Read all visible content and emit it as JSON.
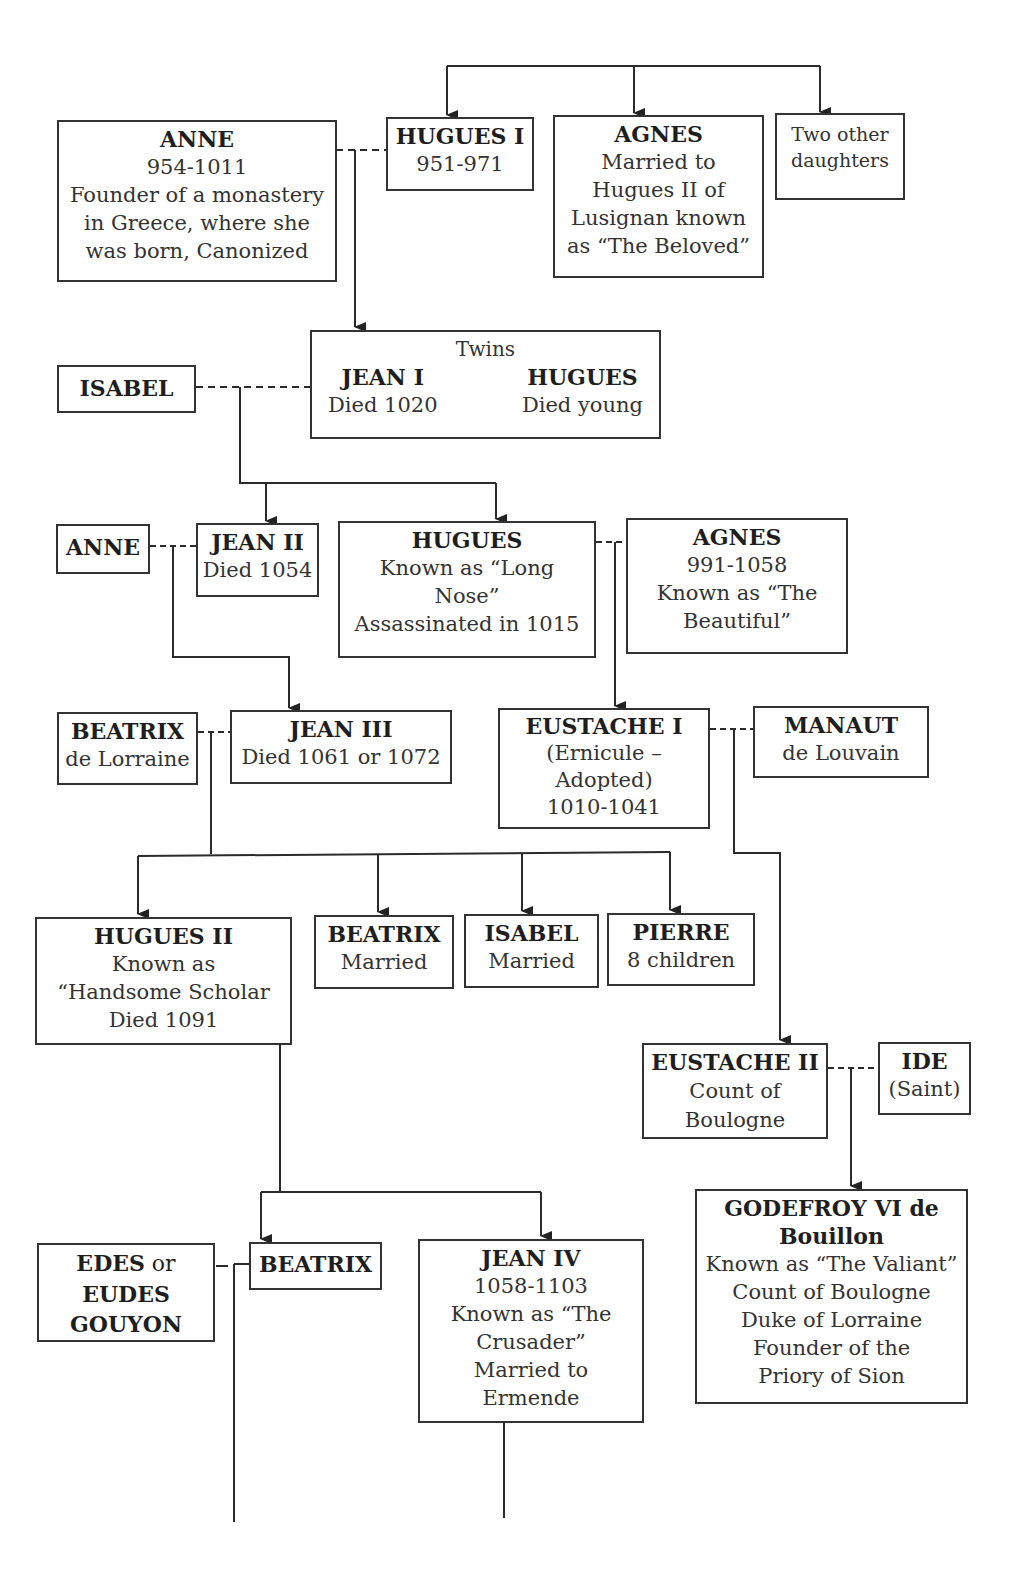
{
  "diagram": {
    "type": "family-tree",
    "nodes": {
      "anne_954": {
        "name": "ANNE",
        "lines": [
          "954-1011",
          "Founder of a monastery",
          "in Greece, where she",
          "was born, Canonized"
        ]
      },
      "hugues_i": {
        "name": "HUGUES I",
        "lines": [
          "951-971"
        ]
      },
      "agnes_beloved": {
        "name": "AGNES",
        "lines": [
          "Married to",
          "Hugues II of",
          "Lusignan known",
          "as “The Beloved”"
        ]
      },
      "two_daughters": {
        "name": "",
        "lines": [
          "Two other",
          "daughters"
        ]
      },
      "twins": {
        "caption": "Twins",
        "left_name": "JEAN I",
        "left_line": "Died 1020",
        "right_name": "HUGUES",
        "right_line": "Died young"
      },
      "isabel_1": {
        "name": "ISABEL",
        "lines": []
      },
      "anne_2": {
        "name": "ANNE",
        "lines": []
      },
      "jean_ii": {
        "name": "JEAN II",
        "lines": [
          "Died 1054"
        ]
      },
      "hugues_long_nose": {
        "name": "HUGUES",
        "lines": [
          "Known as “Long",
          "Nose”",
          "Assassinated in 1015"
        ]
      },
      "agnes_beautiful": {
        "name": "AGNES",
        "lines": [
          "991-1058",
          "Known as “The",
          "Beautiful”"
        ]
      },
      "beatrix_lorraine": {
        "name": "BEATRIX",
        "lines": [
          "de Lorraine"
        ]
      },
      "jean_iii": {
        "name": "JEAN III",
        "lines": [
          "Died 1061 or 1072"
        ]
      },
      "eustache_i": {
        "name": "EUSTACHE I",
        "lines": [
          "(Ernicule –",
          "Adopted)",
          "1010-1041"
        ]
      },
      "manaut": {
        "name": "MANAUT",
        "lines": [
          "de Louvain"
        ]
      },
      "hugues_ii": {
        "name": "HUGUES II",
        "lines": [
          "Known as",
          "“Handsome Scholar",
          "Died 1091"
        ]
      },
      "beatrix_married": {
        "name": "BEATRIX",
        "lines": [
          "Married"
        ]
      },
      "isabel_married": {
        "name": "ISABEL",
        "lines": [
          "Married"
        ]
      },
      "pierre": {
        "name": "PIERRE",
        "lines": [
          "8 children"
        ]
      },
      "eustache_ii": {
        "name": "EUSTACHE II",
        "lines": [
          "Count of",
          "Boulogne"
        ]
      },
      "ide": {
        "name": "IDE",
        "lines": [
          "(Saint)"
        ]
      },
      "godefroy": {
        "name": "GODEFROY VI de",
        "name2": "Bouillon",
        "lines": [
          "Known as “The Valiant”",
          "Count of Boulogne",
          "Duke of Lorraine",
          "Founder of the",
          "Priory of Sion"
        ]
      },
      "edes": {
        "name_a": "EDES",
        "or": " or",
        "name_b": "EUDES",
        "name_c": "GOUYON"
      },
      "beatrix_3": {
        "name": "BEATRIX",
        "lines": []
      },
      "jean_iv": {
        "name": "JEAN IV",
        "lines": [
          "1058-1103",
          "Known as “The",
          "Crusader”",
          "Married to",
          "Ermende"
        ]
      }
    },
    "colors": {
      "line": "#2b2b2b",
      "border": "#333333",
      "background": "#ffffff"
    }
  }
}
